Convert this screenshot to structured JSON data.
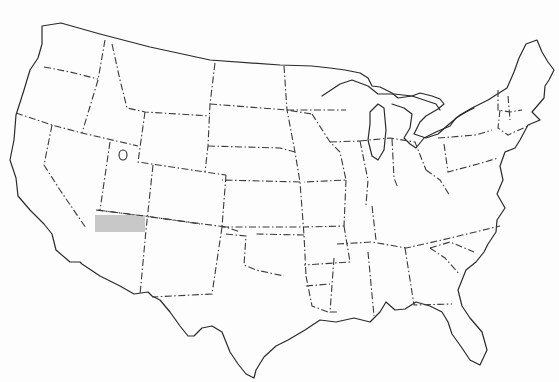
{
  "map": {
    "type": "outline-map",
    "subject": "contiguous United States",
    "style": "black outline with dash-dot state borders",
    "background_color": "#fdfdfd",
    "line_color": "#2a2a2a",
    "highlight": {
      "region": "northwest Arizona (area south of the Utah border, west portion)",
      "fill_color": "#c8c8c8",
      "bbox_px": {
        "x": 95,
        "y": 215,
        "width": 50,
        "height": 17
      }
    },
    "labels": []
  }
}
